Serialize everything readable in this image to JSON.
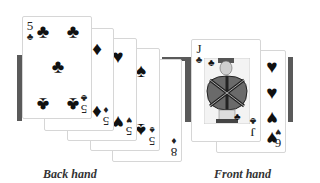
{
  "back_hand": {
    "label": "Back hand",
    "cards": [
      {
        "rank": "5",
        "suit": "♣"
      },
      {
        "rank": "5",
        "suit": "♦"
      },
      {
        "rank": "5",
        "suit": "♥"
      },
      {
        "rank": "5",
        "suit": "♠"
      },
      {
        "rank": "8",
        "suit": "♦"
      }
    ]
  },
  "front_hand": {
    "label": "Front hand",
    "cards": [
      {
        "rank": "J",
        "suit": "♣"
      },
      {
        "rank": "6",
        "suit": "♥"
      }
    ]
  },
  "colors": {
    "bar": "#5a5a5a",
    "card_border": "#d6d6d6"
  }
}
